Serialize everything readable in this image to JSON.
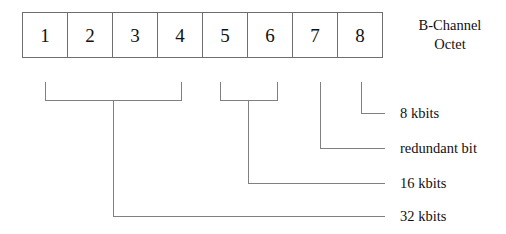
{
  "diagram": {
    "title_lines": [
      "B-Channel",
      "Octet"
    ],
    "octet": {
      "bits": [
        "1",
        "2",
        "3",
        "4",
        "5",
        "6",
        "7",
        "8"
      ]
    },
    "annotations": [
      {
        "label": "8 kbits",
        "bits": "8"
      },
      {
        "label": "redundant bit",
        "bits": "7"
      },
      {
        "label": "16 kbits",
        "bits": "5-6"
      },
      {
        "label": "32 kbits",
        "bits": "1-4"
      }
    ],
    "colors": {
      "background": "#ffffff",
      "line": "#808080",
      "box_border": "#6e6e6e",
      "text": "#111111"
    }
  }
}
